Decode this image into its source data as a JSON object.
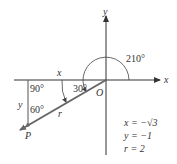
{
  "diagram": {
    "axes": {
      "x_label": "x",
      "y_label": "y"
    },
    "origin_label": "O",
    "point_label": "P",
    "angles": {
      "standard": "210°",
      "reference": "30°",
      "right": "90°",
      "at_p": "60°"
    },
    "triangle_sides": {
      "horizontal": "x",
      "vertical": "y",
      "hypotenuse": "r"
    },
    "values": {
      "x": "x = −√3",
      "y": "y = −1",
      "r": "r = 2"
    },
    "colors": {
      "axis": "#333333",
      "terminal_side": "#666666",
      "text": "#333333"
    }
  }
}
